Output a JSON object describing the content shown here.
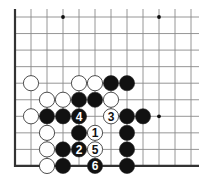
{
  "diagram": {
    "type": "go-board-fragment",
    "edges": [
      "left",
      "bottom"
    ],
    "columns": 12,
    "rows": 10,
    "colors": {
      "background": "#ffffff",
      "grid": "#8a8a8a",
      "edge": "#333333",
      "black_stone": "#111111",
      "white_stone": "#ffffff",
      "stone_outline": "#222222",
      "hoshi": "#111111"
    },
    "hoshi": [
      {
        "col": 3,
        "row": 0
      },
      {
        "col": 9,
        "row": 0
      },
      {
        "col": 9,
        "row": 6
      }
    ],
    "stones": [
      {
        "color": "white",
        "col": 1,
        "row": 4,
        "label": ""
      },
      {
        "color": "white",
        "col": 4,
        "row": 4,
        "label": ""
      },
      {
        "color": "white",
        "col": 5,
        "row": 4,
        "label": ""
      },
      {
        "color": "black",
        "col": 6,
        "row": 4,
        "label": ""
      },
      {
        "color": "black",
        "col": 7,
        "row": 4,
        "label": ""
      },
      {
        "color": "white",
        "col": 2,
        "row": 5,
        "label": ""
      },
      {
        "color": "white",
        "col": 3,
        "row": 5,
        "label": ""
      },
      {
        "color": "black",
        "col": 4,
        "row": 5,
        "label": ""
      },
      {
        "color": "black",
        "col": 5,
        "row": 5,
        "label": ""
      },
      {
        "color": "white",
        "col": 6,
        "row": 5,
        "label": ""
      },
      {
        "color": "white",
        "col": 1,
        "row": 6,
        "label": ""
      },
      {
        "color": "black",
        "col": 2,
        "row": 6,
        "label": ""
      },
      {
        "color": "black",
        "col": 3,
        "row": 6,
        "label": ""
      },
      {
        "color": "black",
        "col": 4,
        "row": 6,
        "label": "4"
      },
      {
        "color": "white",
        "col": 6,
        "row": 6,
        "label": "3"
      },
      {
        "color": "black",
        "col": 7,
        "row": 6,
        "label": ""
      },
      {
        "color": "black",
        "col": 8,
        "row": 6,
        "label": ""
      },
      {
        "color": "white",
        "col": 2,
        "row": 7,
        "label": ""
      },
      {
        "color": "black",
        "col": 4,
        "row": 7,
        "label": ""
      },
      {
        "color": "white",
        "col": 5,
        "row": 7,
        "label": "1"
      },
      {
        "color": "black",
        "col": 7,
        "row": 7,
        "label": ""
      },
      {
        "color": "white",
        "col": 2,
        "row": 8,
        "label": ""
      },
      {
        "color": "black",
        "col": 3,
        "row": 8,
        "label": ""
      },
      {
        "color": "black",
        "col": 4,
        "row": 8,
        "label": "2"
      },
      {
        "color": "white",
        "col": 5,
        "row": 8,
        "label": "5"
      },
      {
        "color": "black",
        "col": 7,
        "row": 8,
        "label": ""
      },
      {
        "color": "white",
        "col": 2,
        "row": 9,
        "label": ""
      },
      {
        "color": "black",
        "col": 3,
        "row": 9,
        "label": ""
      },
      {
        "color": "black",
        "col": 5,
        "row": 9,
        "label": "6"
      },
      {
        "color": "black",
        "col": 7,
        "row": 9,
        "label": ""
      }
    ]
  }
}
